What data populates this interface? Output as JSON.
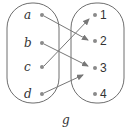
{
  "diagram": {
    "type": "function-mapping",
    "caption": "g",
    "domain": {
      "elements": [
        {
          "label": "a",
          "y": 15
        },
        {
          "label": "b",
          "y": 43
        },
        {
          "label": "c",
          "y": 67
        },
        {
          "label": "d",
          "y": 94
        }
      ]
    },
    "codomain": {
      "elements": [
        {
          "label": "1",
          "y": 15
        },
        {
          "label": "2",
          "y": 41
        },
        {
          "label": "3",
          "y": 68
        },
        {
          "label": "4",
          "y": 94
        }
      ]
    },
    "mappings": [
      {
        "from": "a",
        "to": "2"
      },
      {
        "from": "b",
        "to": "3"
      },
      {
        "from": "c",
        "to": "1"
      },
      {
        "from": "d",
        "to": "3"
      }
    ],
    "colors": {
      "outline": "#6e6e6e",
      "dot": "#8a8a8a",
      "arrow": "#777777",
      "text": "#333333"
    }
  }
}
